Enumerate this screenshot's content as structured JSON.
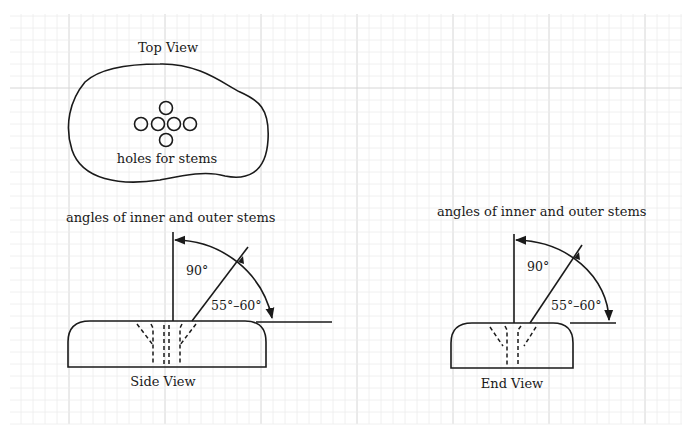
{
  "diagram": {
    "colors": {
      "ink": "#1a1a1a",
      "grid_major": "#d6d6d6",
      "grid_minor": "#ececec",
      "background": "#ffffff"
    },
    "top_view": {
      "title": "Top View",
      "caption": "holes for stems",
      "hole_count": 6
    },
    "side_view": {
      "heading": "angles of inner and outer stems",
      "caption": "Side View",
      "angle_vertical": "90°",
      "angle_outer": "55°–60°"
    },
    "end_view": {
      "heading": "angles of inner and outer stems",
      "caption": "End View",
      "angle_vertical": "90°",
      "angle_outer": "55°–60°"
    }
  }
}
